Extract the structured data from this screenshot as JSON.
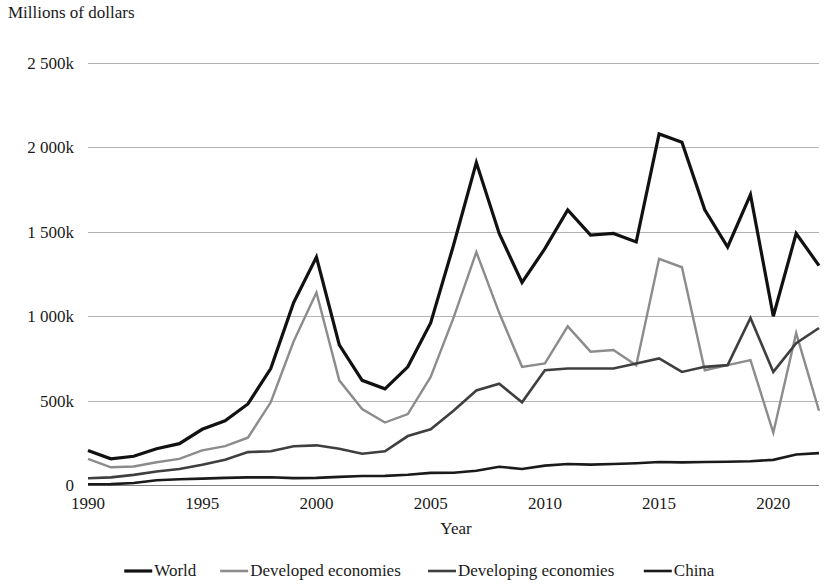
{
  "chart_data": {
    "type": "line",
    "title": "",
    "ylabel": "Millions of dollars",
    "xlabel": "Year",
    "grid": true,
    "legend_position": "bottom",
    "xlim": [
      1990,
      2022
    ],
    "ylim": [
      0,
      2500
    ],
    "y_unit": "k",
    "y_ticks": [
      0,
      500,
      1000,
      1500,
      2000,
      2500
    ],
    "y_tick_labels": [
      "0",
      "500k",
      "1 000k",
      "1 500k",
      "2 000k",
      "2 500k"
    ],
    "x_ticks": [
      1990,
      1995,
      2000,
      2005,
      2010,
      2015,
      2020
    ],
    "x_tick_labels": [
      "1990",
      "1995",
      "2000",
      "2005",
      "2010",
      "2015",
      "2020"
    ],
    "x": [
      1990,
      1991,
      1992,
      1993,
      1994,
      1995,
      1996,
      1997,
      1998,
      1999,
      2000,
      2001,
      2002,
      2003,
      2004,
      2005,
      2006,
      2007,
      2008,
      2009,
      2010,
      2011,
      2012,
      2013,
      2014,
      2015,
      2016,
      2017,
      2018,
      2019,
      2020,
      2021,
      2022
    ],
    "series": [
      {
        "name": "World",
        "color": "#111111",
        "width": 3.2,
        "values": [
          205,
          155,
          170,
          215,
          245,
          330,
          380,
          480,
          690,
          1080,
          1350,
          830,
          620,
          570,
          700,
          960,
          1420,
          1910,
          1490,
          1200,
          1400,
          1630,
          1480,
          1490,
          1440,
          2080,
          2030,
          1630,
          1410,
          1720,
          1000,
          1490,
          1300
        ]
      },
      {
        "name": "Developed economies",
        "color": "#8c8c8c",
        "width": 2.4,
        "values": [
          155,
          105,
          110,
          135,
          155,
          205,
          230,
          280,
          490,
          850,
          1140,
          620,
          450,
          370,
          420,
          640,
          990,
          1380,
          1020,
          700,
          720,
          940,
          790,
          800,
          710,
          1340,
          1290,
          680,
          710,
          740,
          310,
          900,
          440
        ]
      },
      {
        "name": "Developing economies",
        "color": "#3f3f3f",
        "width": 2.6,
        "values": [
          40,
          45,
          60,
          80,
          95,
          120,
          150,
          195,
          200,
          230,
          235,
          215,
          185,
          200,
          290,
          330,
          440,
          560,
          600,
          490,
          680,
          690,
          690,
          690,
          720,
          750,
          670,
          700,
          710,
          990,
          670,
          840,
          930
        ]
      },
      {
        "name": "China",
        "color": "#1a1a1a",
        "width": 2.6,
        "values": [
          4,
          5,
          12,
          28,
          34,
          38,
          42,
          45,
          46,
          41,
          42,
          48,
          53,
          54,
          61,
          72,
          73,
          84,
          108,
          95,
          115,
          124,
          121,
          124,
          129,
          136,
          134,
          136,
          138,
          141,
          149,
          181,
          189
        ]
      }
    ]
  },
  "legend": {
    "items": [
      {
        "label": "World"
      },
      {
        "label": "Developed economies"
      },
      {
        "label": "Developing economies"
      },
      {
        "label": "China"
      }
    ]
  }
}
